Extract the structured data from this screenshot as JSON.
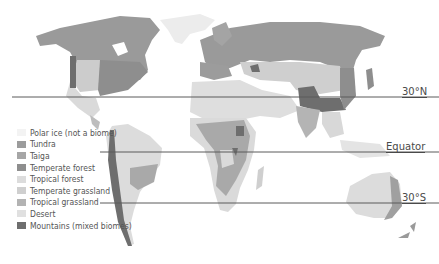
{
  "map": {
    "title_clipped": "",
    "latitude_lines": [
      {
        "label": "30°N",
        "y": 97
      },
      {
        "label": "Equator",
        "y": 152
      },
      {
        "label": "30°S",
        "y": 203
      }
    ],
    "legend": {
      "items": [
        {
          "label": "Polar ice (not a biome)",
          "color": "#f3f3f3"
        },
        {
          "label": "Tundra",
          "color": "#9c9c9c"
        },
        {
          "label": "Taiga",
          "color": "#a6a6a6"
        },
        {
          "label": "Temperate forest",
          "color": "#8e8e8e"
        },
        {
          "label": "Tropical forest",
          "color": "#dcdcdc"
        },
        {
          "label": "Temperate grassland",
          "color": "#cfcfcf"
        },
        {
          "label": "Tropical grassland",
          "color": "#b3b3b3"
        },
        {
          "label": "Desert",
          "color": "#e0e0e0"
        },
        {
          "label": "Mountains (mixed biomes)",
          "color": "#6e6e6e"
        }
      ]
    }
  }
}
